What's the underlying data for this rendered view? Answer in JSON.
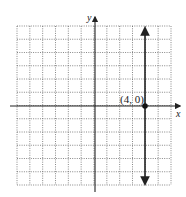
{
  "chart_data": {
    "type": "line",
    "title": "",
    "xlabel": "x",
    "ylabel": "y",
    "xlim": [
      -6,
      6
    ],
    "ylim": [
      -6,
      6
    ],
    "grid": true,
    "grid_style": "dotted",
    "series": [
      {
        "name": "x = 4",
        "kind": "vertical-line",
        "x": [
          4,
          4
        ],
        "y": [
          -6,
          6
        ],
        "arrows": "both",
        "color": "#222222"
      }
    ],
    "points": [
      {
        "x": 4,
        "y": 0,
        "label": "(4, 0)"
      }
    ],
    "annotations": [
      "(4, 0)"
    ]
  },
  "labels": {
    "x_axis": "x",
    "y_axis": "y",
    "point": "(4, 0)"
  }
}
